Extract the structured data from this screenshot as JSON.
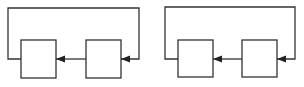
{
  "diagrams": [
    {
      "id": "loop-1",
      "blocks": [
        {
          "name": "block-left",
          "x": 21,
          "y": 40,
          "w": 35,
          "h": 38
        },
        {
          "name": "block-right",
          "x": 86,
          "y": 40,
          "w": 35,
          "h": 38
        }
      ],
      "feedback": {
        "left_x": 8,
        "top_y": 8,
        "right_x": 139,
        "signal_y": 59
      }
    },
    {
      "id": "loop-2",
      "blocks": [
        {
          "name": "block-left",
          "x": 178,
          "y": 40,
          "w": 35,
          "h": 37
        },
        {
          "name": "block-right",
          "x": 242,
          "y": 40,
          "w": 35,
          "h": 37
        }
      ],
      "feedback": {
        "left_x": 165,
        "top_y": 7,
        "right_x": 295,
        "signal_y": 59
      }
    }
  ],
  "colors": {
    "stroke": "#333333",
    "background": "#ffffff"
  }
}
